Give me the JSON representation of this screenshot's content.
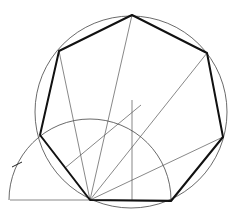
{
  "diagram": {
    "colors": {
      "background": "#ffffff",
      "thin_line": "#555555",
      "thick_line": "#111111"
    },
    "circumcircle": {
      "cx": 131,
      "cy": 112,
      "r": 96
    },
    "semicircle": {
      "cx": 90,
      "cy": 200,
      "r": 81
    },
    "heptagon_vertices": [
      [
        132,
        15
      ],
      [
        207,
        53
      ],
      [
        223,
        137
      ],
      [
        171,
        201
      ],
      [
        90,
        200
      ],
      [
        40,
        135
      ],
      [
        59,
        51
      ]
    ],
    "baseline": {
      "x1": 10,
      "y1": 200,
      "x2": 171,
      "y2": 200
    },
    "radiating_lines": [
      [
        90,
        200,
        132,
        15
      ],
      [
        90,
        200,
        207,
        53
      ],
      [
        90,
        200,
        223,
        137
      ],
      [
        90,
        200,
        59,
        51
      ]
    ],
    "construction_lines": {
      "vertical": [
        132,
        100,
        132,
        200
      ],
      "diagonal": [
        65,
        168,
        141,
        105
      ]
    },
    "tick_mark": [
      12,
      167,
      22,
      162
    ]
  }
}
